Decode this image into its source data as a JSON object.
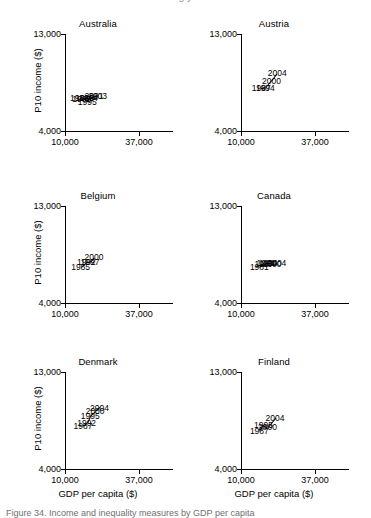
{
  "figure": {
    "top_cut_text": "g  y",
    "caption_cut_text": "Figure  34. Income and inequality measures by GDP per capita"
  },
  "axes": {
    "x_title": "GDP per capita ($)",
    "y_title": "P10 income ($)",
    "x_ticks": [
      "10,000",
      "37,000"
    ],
    "y_ticks": [
      "13,000",
      "4,000"
    ],
    "x_range": [
      10000,
      37000
    ],
    "y_range": [
      4000,
      13000
    ]
  },
  "chart_data": {
    "type": "scatter",
    "title": "",
    "xlabel": "GDP per capita ($)",
    "ylabel": "P10 income ($)",
    "xlim": [
      10000,
      37000
    ],
    "ylim": [
      4000,
      13000
    ],
    "grid": false,
    "legend": "none",
    "point_labels": "year",
    "layout": {
      "rows": 3,
      "cols": 2
    },
    "panels": [
      {
        "name": "Australia",
        "points": [
          {
            "label": "1981",
            "x": 15300,
            "y": 7050
          },
          {
            "label": "1985",
            "x": 16100,
            "y": 6980
          },
          {
            "label": "1989",
            "x": 17200,
            "y": 7020
          },
          {
            "label": "1995",
            "x": 18100,
            "y": 6700
          },
          {
            "label": "1994",
            "x": 18600,
            "y": 7060
          },
          {
            "label": "2001",
            "x": 20600,
            "y": 7230
          },
          {
            "label": "2003",
            "x": 21900,
            "y": 7280
          }
        ]
      },
      {
        "name": "Austria",
        "points": [
          {
            "label": "1987",
            "x": 17400,
            "y": 8000
          },
          {
            "label": "1994",
            "x": 18900,
            "y": 7950
          },
          {
            "label": "2000",
            "x": 21100,
            "y": 8650
          },
          {
            "label": "2004",
            "x": 23200,
            "y": 9350
          }
        ]
      },
      {
        "name": "Belgium",
        "points": [
          {
            "label": "1985",
            "x": 15700,
            "y": 7350
          },
          {
            "label": "1992",
            "x": 17800,
            "y": 7800
          },
          {
            "label": "1997",
            "x": 19100,
            "y": 7820
          },
          {
            "label": "2000",
            "x": 20600,
            "y": 8250
          }
        ]
      },
      {
        "name": "Canada",
        "points": [
          {
            "label": "1981",
            "x": 16700,
            "y": 7300
          },
          {
            "label": "1987",
            "x": 18400,
            "y": 7650
          },
          {
            "label": "1991",
            "x": 19100,
            "y": 7700
          },
          {
            "label": "1994",
            "x": 19900,
            "y": 7680
          },
          {
            "label": "2000",
            "x": 21300,
            "y": 7620
          },
          {
            "label": "2004",
            "x": 23100,
            "y": 7700
          }
        ]
      },
      {
        "name": "Denmark",
        "points": [
          {
            "label": "1987",
            "x": 16600,
            "y": 7950
          },
          {
            "label": "1992",
            "x": 17900,
            "y": 8250
          },
          {
            "label": "1995",
            "x": 19200,
            "y": 8950
          },
          {
            "label": "2000",
            "x": 21000,
            "y": 9350
          },
          {
            "label": "2004",
            "x": 22600,
            "y": 9700
          }
        ]
      },
      {
        "name": "Finland",
        "points": [
          {
            "label": "1987",
            "x": 16700,
            "y": 7550
          },
          {
            "label": "1995",
            "x": 18200,
            "y": 8100
          },
          {
            "label": "2000",
            "x": 19700,
            "y": 7900
          },
          {
            "label": "2004",
            "x": 22400,
            "y": 8750
          }
        ]
      }
    ]
  }
}
